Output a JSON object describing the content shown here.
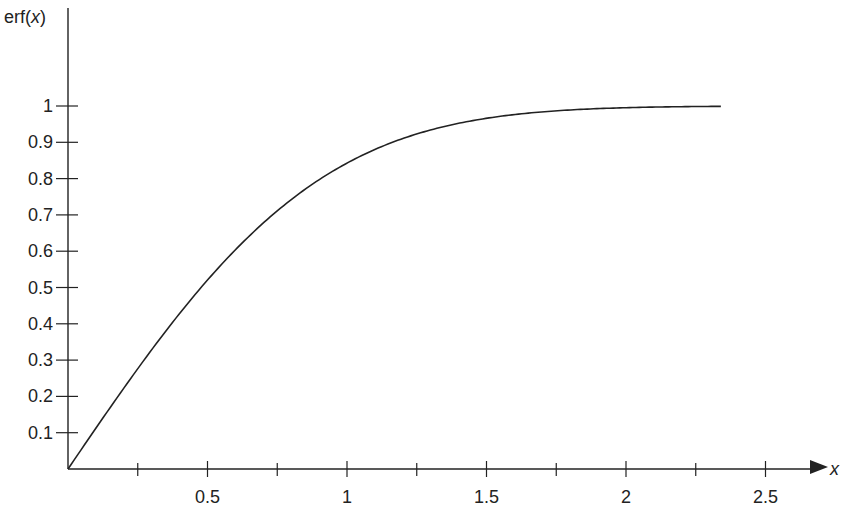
{
  "chart_data": {
    "type": "line",
    "title": "",
    "xlabel": "x",
    "ylabel": "erf(x)",
    "ylabel_parts": {
      "fn": "erf(",
      "var": "x",
      "close": ")"
    },
    "xlim": [
      0,
      2.7
    ],
    "ylim": [
      0,
      1.1
    ],
    "grid": false,
    "legend": null,
    "x_ticks_major": [
      0.5,
      1,
      1.5,
      2,
      2.5
    ],
    "x_tick_labels": [
      "0.5",
      "1",
      "1.5",
      "2",
      "2.5"
    ],
    "x_ticks_minor": [
      0.25,
      0.75,
      1.25,
      1.75,
      2.25
    ],
    "y_ticks": [
      0.1,
      0.2,
      0.3,
      0.4,
      0.5,
      0.6,
      0.7,
      0.8,
      0.9,
      1
    ],
    "y_tick_labels": [
      "0.1",
      "0.2",
      "0.3",
      "0.4",
      "0.5",
      "0.6",
      "0.7",
      "0.8",
      "0.9",
      "1"
    ],
    "series": [
      {
        "name": "erf(x)",
        "color": "#222222",
        "x": [
          0,
          0.1,
          0.2,
          0.3,
          0.4,
          0.5,
          0.6,
          0.7,
          0.8,
          0.9,
          1.0,
          1.1,
          1.2,
          1.3,
          1.4,
          1.5,
          1.6,
          1.7,
          1.8,
          1.9,
          2.0,
          2.1,
          2.2,
          2.34
        ],
        "y": [
          0,
          0.112,
          0.223,
          0.329,
          0.428,
          0.52,
          0.604,
          0.678,
          0.742,
          0.797,
          0.843,
          0.88,
          0.91,
          0.934,
          0.952,
          0.966,
          0.976,
          0.984,
          0.989,
          0.993,
          0.995,
          0.997,
          0.998,
          0.999
        ]
      }
    ]
  },
  "layout": {
    "origin_px": [
      68,
      469
    ],
    "px_per_x_unit": 279,
    "px_per_y_unit": 363
  }
}
